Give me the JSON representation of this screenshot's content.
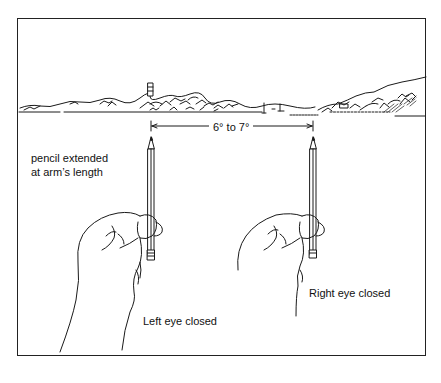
{
  "diagram": {
    "measurement_label": "6° to 7°",
    "pencil_caption_line1": "pencil extended",
    "pencil_caption_line2": "at arm’s length",
    "left_caption": "Left eye closed",
    "right_caption": "Right eye closed",
    "elements": [
      "horizon-landscape",
      "lighthouse",
      "left-hand-with-pencil",
      "right-hand-with-pencil",
      "dimension-arrow"
    ]
  }
}
